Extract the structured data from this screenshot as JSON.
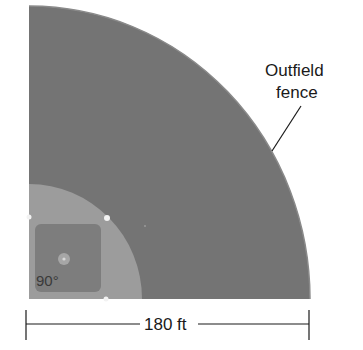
{
  "diagram": {
    "type": "baseball-field-sector",
    "labels": {
      "fence_line1": "Outfield",
      "fence_line2": "fence",
      "dimension": "180 ft",
      "angle": "90°"
    },
    "colors": {
      "outfield": "#747474",
      "infield_dirt": "#9c9c9c",
      "infield_grass": "#7c7c7c",
      "mound": "#a8a8a8",
      "bases": "#f2f2f2",
      "line": "#1a1a1a",
      "background": "#ffffff"
    },
    "geometry": {
      "home_plate": [
        29,
        299
      ],
      "fence_radius": 281,
      "infield_radius": 113,
      "fence_distance_ft": 180,
      "central_angle_deg": 90
    }
  }
}
